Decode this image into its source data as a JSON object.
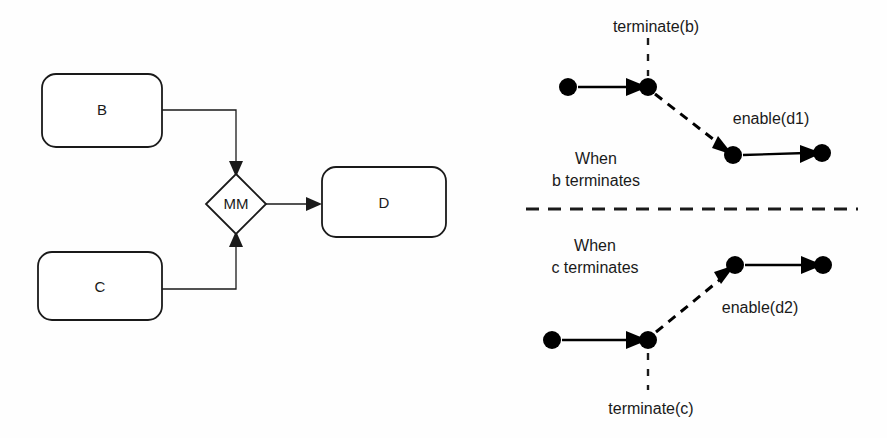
{
  "figure": {
    "background_color": "#fefefe",
    "line_color": "#1a1a1a"
  },
  "flow_diagram": {
    "nodes": [
      {
        "id": "B",
        "label": "B",
        "shape": "rounded-rectangle",
        "x": 42,
        "y": 74,
        "w": 120,
        "h": 73
      },
      {
        "id": "C",
        "label": "C",
        "shape": "rounded-rectangle",
        "x": 38,
        "y": 252,
        "w": 124,
        "h": 68
      },
      {
        "id": "D",
        "label": "D",
        "shape": "rounded-rectangle",
        "x": 322,
        "y": 167,
        "w": 124,
        "h": 70
      },
      {
        "id": "MM",
        "label": "MM",
        "shape": "diamond",
        "cx": 236,
        "cy": 204,
        "rx": 28,
        "ry": 30
      }
    ],
    "edges": [
      {
        "from": "B",
        "to": "MM",
        "style": "solid",
        "arrow": "down"
      },
      {
        "from": "C",
        "to": "MM",
        "style": "solid",
        "arrow": "up"
      },
      {
        "from": "MM",
        "to": "D",
        "style": "solid",
        "arrow": "right"
      }
    ]
  },
  "sequence_panels": [
    {
      "id": "when-b-terminates",
      "caption_line1": "When",
      "caption_line2": "b terminates",
      "event_label": "terminate(b)",
      "effect_label": "enable(d1)",
      "events": [
        {
          "cx": 568,
          "cy": 87
        },
        {
          "cx": 648,
          "cy": 87
        },
        {
          "cx": 733,
          "cy": 155
        },
        {
          "cx": 822,
          "cy": 153
        }
      ]
    },
    {
      "id": "when-c-terminates",
      "caption_line1": "When",
      "caption_line2": "c terminates",
      "event_label": "terminate(c)",
      "effect_label": "enable(d2)",
      "events": [
        {
          "cx": 552,
          "cy": 340
        },
        {
          "cx": 648,
          "cy": 340
        },
        {
          "cx": 735,
          "cy": 265
        },
        {
          "cx": 823,
          "cy": 265
        }
      ]
    }
  ],
  "divider": {
    "style": "dashed",
    "x1": 526,
    "x2": 858,
    "y": 209
  }
}
